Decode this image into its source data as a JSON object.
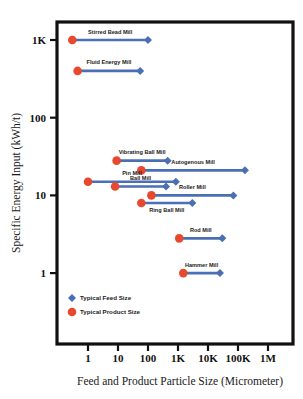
{
  "chart_data": {
    "type": "scatter",
    "title": "",
    "xlabel": "Feed and Product Particle Size (Micrometer)",
    "ylabel": "Specific Energy Input (kWh/t)",
    "x_scale": "log",
    "y_scale": "log",
    "xlim": [
      0.1,
      3000000
    ],
    "ylim": [
      0.3,
      3000
    ],
    "x_ticks": [
      {
        "label": "1",
        "value": 1
      },
      {
        "label": "10",
        "value": 10
      },
      {
        "label": "100",
        "value": 100
      },
      {
        "label": "1K",
        "value": 1000
      },
      {
        "label": "10K",
        "value": 10000
      },
      {
        "label": "100K",
        "value": 100000
      },
      {
        "label": "1M",
        "value": 1000000
      }
    ],
    "y_ticks": [
      {
        "label": "1K",
        "value": 1000
      },
      {
        "label": "100",
        "value": 100
      },
      {
        "label": "10",
        "value": 10
      },
      {
        "label": "1",
        "value": 1
      }
    ],
    "grid": false,
    "legend_position": "bottom-left",
    "legend": [
      {
        "name": "Typical Feed Size",
        "marker": "diamond",
        "color": "#4A6FB5"
      },
      {
        "name": "Typical Product Size",
        "marker": "circle",
        "color": "#E8482C"
      }
    ],
    "series": [
      {
        "name": "Stirred Bead Mill",
        "energy": 1000,
        "product_size": 0.3,
        "feed_size": 100,
        "label_side": "above"
      },
      {
        "name": "Fluid Energy Mill",
        "energy": 400,
        "product_size": 0.45,
        "feed_size": 55,
        "label_side": "above"
      },
      {
        "name": "Vibrating Ball Mill",
        "energy": 28,
        "product_size": 9,
        "feed_size": 450,
        "label_side": "above"
      },
      {
        "name": "Autogenous Mill",
        "energy": 21,
        "product_size": 60,
        "feed_size": 170000,
        "label_side": "above"
      },
      {
        "name": "Pin Mill",
        "energy": 15,
        "product_size": 1,
        "feed_size": 850,
        "label_side": "above"
      },
      {
        "name": "Ball Mill",
        "energy": 13,
        "product_size": 8,
        "feed_size": 400,
        "label_side": "above"
      },
      {
        "name": "Roller Mill",
        "energy": 10,
        "product_size": 130,
        "feed_size": 70000,
        "label_side": "above"
      },
      {
        "name": "Ring Ball Mill",
        "energy": 8,
        "product_size": 60,
        "feed_size": 3000,
        "label_side": "below"
      },
      {
        "name": "Rod Mill",
        "energy": 2.8,
        "product_size": 1100,
        "feed_size": 30000,
        "label_side": "above"
      },
      {
        "name": "Hammer Mill",
        "energy": 1,
        "product_size": 1500,
        "feed_size": 25000,
        "label_side": "above"
      }
    ],
    "colors": {
      "feed_marker": "#4A6FB5",
      "product_marker": "#E8482C",
      "connector": "#4A6FB5",
      "frame": "#111111",
      "background": "#ffffff"
    }
  }
}
